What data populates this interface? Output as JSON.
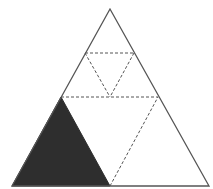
{
  "diagram": {
    "type": "geometric-figure",
    "colors": {
      "background": "#ffffff",
      "outline": "#555555",
      "dashed": "#555555",
      "fill": "#2e2e2e"
    },
    "outer_triangle": {
      "points": "110,9 12,186 209,186"
    },
    "shaded_triangle": {
      "points": "12,186 61,97 110,186"
    },
    "dashed_lines": [
      {
        "x1": 61,
        "y1": 97,
        "x2": 158,
        "y2": 97
      },
      {
        "x1": 110,
        "y1": 186,
        "x2": 158,
        "y2": 97
      },
      {
        "x1": 85,
        "y1": 53,
        "x2": 134,
        "y2": 53
      },
      {
        "x1": 85,
        "y1": 53,
        "x2": 110,
        "y2": 97
      },
      {
        "x1": 134,
        "y1": 53,
        "x2": 110,
        "y2": 97
      }
    ]
  }
}
